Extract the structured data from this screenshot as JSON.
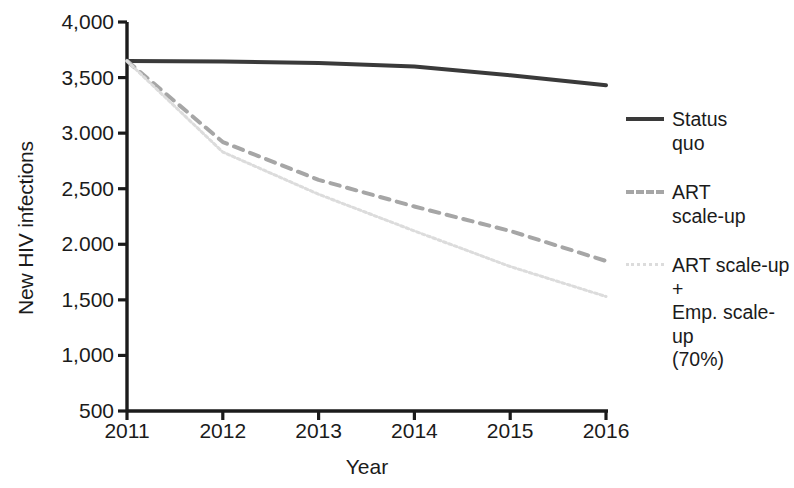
{
  "chart_data": {
    "type": "line",
    "title": "",
    "xlabel": "Year",
    "ylabel": "New HIV infections",
    "categories": [
      "2011",
      "2012",
      "2013",
      "2014",
      "2015",
      "2016"
    ],
    "x": [
      2011,
      2012,
      2013,
      2014,
      2015,
      2016
    ],
    "xlim": [
      2011,
      2016
    ],
    "ylim": [
      500,
      4000
    ],
    "grid": false,
    "legend_position": "right",
    "y_tick_values": [
      4000,
      3500,
      3000,
      2500,
      2000,
      1500,
      1000,
      500
    ],
    "y_tick_labels": [
      "4,000",
      "3,500",
      "3.000",
      "2,500",
      "2.000",
      "1,500",
      "1,000",
      "500"
    ],
    "x_tick_labels": [
      "2011",
      "2012",
      "2013",
      "2014",
      "2015",
      "2016"
    ],
    "series": [
      {
        "name": "Status quo",
        "legend_label": "Status\nquo",
        "style": "solid",
        "color": "#3a3a3a",
        "width": 4,
        "values": [
          3650,
          3645,
          3630,
          3600,
          3520,
          3430
        ]
      },
      {
        "name": "ART scale-up",
        "legend_label": "ART\nscale-up",
        "style": "dashed",
        "color": "#a6a6a6",
        "width": 4,
        "values": [
          3650,
          2920,
          2580,
          2340,
          2120,
          1850
        ]
      },
      {
        "name": "ART scale-up + Emp. scale-up (70%)",
        "legend_label": "ART scale-up +\nEmp. scale-up\n(70%)",
        "style": "dotted",
        "color": "#dcdcdc",
        "width": 3,
        "values": [
          3650,
          2830,
          2450,
          2120,
          1800,
          1530
        ]
      }
    ]
  },
  "axes": {
    "axis_color": "#1b1b1b",
    "plot_left": 127,
    "plot_right": 606,
    "plot_top": 22,
    "plot_bottom": 411
  }
}
